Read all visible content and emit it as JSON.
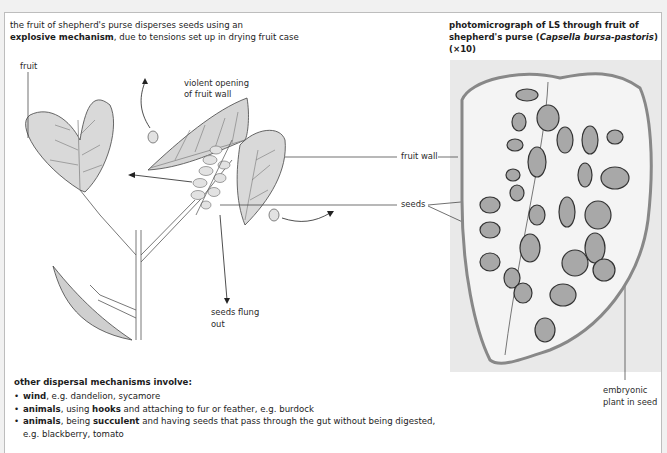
{
  "caption_left": {
    "line1": "the fruit of shepherd's purse disperses seeds using an",
    "line2_bold": "explosive mechanism",
    "line2_rest": ", due to tensions set up in drying fruit case"
  },
  "caption_right": {
    "part1": "photomicrograph of ",
    "part2_bold": "LS",
    "part3": " through fruit of",
    "line2_a": "shepherd's purse (",
    "line2_italic": "Capsella bursa-pastoris",
    "line2_b": ")",
    "line3": "(×10)"
  },
  "diagram_labels": {
    "fruit": "fruit",
    "violent_opening_1": "violent opening",
    "violent_opening_2": "of fruit wall",
    "seeds_flung_1": "seeds flung",
    "seeds_flung_2": "out",
    "fruit_wall": "fruit wall",
    "seeds": "seeds",
    "embryonic_1": "embryonic",
    "embryonic_2": "plant in seed"
  },
  "other_mechanisms": {
    "heading": "other dispersal mechanisms involve:",
    "items": [
      {
        "bold": "wind",
        "rest": ", e.g. dandelion, sycamore"
      },
      {
        "bold": "animals",
        "mid": ", using ",
        "bold2": "hooks",
        "rest": " and attaching to fur or feather, e.g. burdock"
      },
      {
        "bold": "animals",
        "mid": ", being ",
        "bold2": "succulent",
        "rest": " and having seeds that pass through the gut without being digested,",
        "cont": "e.g. blackberry, tomato"
      }
    ]
  },
  "colors": {
    "leaf_fill": "#d9d9d9",
    "line": "#3a3a3a",
    "micro_bg": "#e9e9e9",
    "seed_fill": "#9a9a9a"
  }
}
